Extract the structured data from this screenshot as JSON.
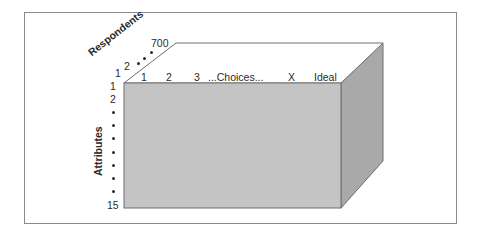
{
  "diagram": {
    "type": "data-cube",
    "axes": {
      "respondents": {
        "title": "Respondents",
        "ticks": [
          "1",
          "2",
          "•",
          "•",
          "•",
          "700"
        ]
      },
      "choices": {
        "ticks": [
          "1",
          "2",
          "3",
          "...Choices...",
          "X",
          "Ideal"
        ]
      },
      "attributes": {
        "title": "Attributes",
        "ticks": [
          "1",
          "2",
          "•",
          "•",
          "•",
          "•",
          "•",
          "•",
          "•",
          "15"
        ]
      }
    },
    "colors": {
      "front_face": "#c4c4c4",
      "side_face": "#a9a9a9",
      "top_face": "#ffffff",
      "edge": "#6e6e6e",
      "frame": "#8a8a8a"
    }
  }
}
